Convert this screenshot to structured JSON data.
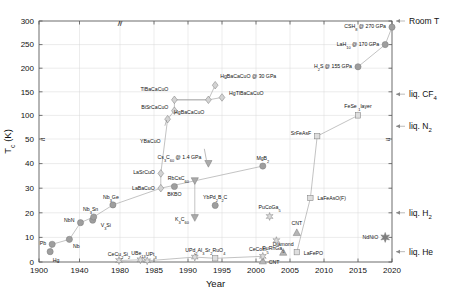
{
  "chart_data": {
    "type": "scatter",
    "title": "",
    "xlabel": "Year",
    "ylabel": "T_c (K)",
    "ylabel_main": "T",
    "ylabel_sub": "c",
    "ylabel_unit": " (K)",
    "grid": true,
    "legend_position": "none",
    "x_axis": {
      "broken": true,
      "break_marker": "//",
      "ticks": [
        1900,
        1940,
        1980,
        1985,
        1990,
        1995,
        2000,
        2005,
        2010,
        2015,
        2020
      ],
      "tick_labels": [
        "1900",
        "1940",
        "1980",
        "1985",
        "1990",
        "1995",
        "2000",
        "2005",
        "2010",
        "2015",
        "2020"
      ],
      "xlim": [
        1900,
        2021
      ]
    },
    "y_axis": {
      "broken": true,
      "break_at": 50,
      "ticks": [
        0,
        10,
        20,
        30,
        40,
        50,
        100,
        150,
        200,
        250,
        300
      ],
      "tick_labels": [
        "0",
        "10",
        "20",
        "30",
        "40",
        "50",
        "100",
        "150",
        "200",
        "250",
        "300"
      ],
      "ylim": [
        0,
        310
      ]
    },
    "right_annotations": [
      {
        "label": "Room T",
        "value": 300
      },
      {
        "label": "liq. CF4",
        "text": "liq. CF",
        "sub": "4",
        "value": 145
      },
      {
        "label": "liq. N2",
        "text": "liq. N",
        "sub": "2",
        "value": 77
      },
      {
        "label": "liq. H2",
        "text": "liq. H",
        "sub": "2",
        "value": 20
      },
      {
        "label": "liq. He",
        "text": "liq. He",
        "sub": "",
        "value": 4.2
      }
    ],
    "series": [
      {
        "name": "BCS / conventional",
        "marker": "circle",
        "color": "#9e9e9e",
        "points": [
          {
            "label": "Hg",
            "text": "Hg",
            "year": 1911,
            "tc": 4.2
          },
          {
            "label": "Pb",
            "text": "Pb",
            "year": 1913,
            "tc": 7.2
          },
          {
            "label": "Nb",
            "text": "Nb",
            "year": 1930,
            "tc": 9.2
          },
          {
            "label": "NbN",
            "text": "NbN",
            "year": 1941,
            "tc": 16.0
          },
          {
            "label": "NbC",
            "text": "V3Si",
            "year": 1953,
            "tc": 17.0
          },
          {
            "label": "Nb3Sn",
            "text": "Nb3Sn",
            "year": 1954,
            "tc": 18.3
          },
          {
            "label": "Nb3Ge",
            "text": "Nb3Ge",
            "year": 1973,
            "tc": 23.2
          },
          {
            "label": "BKBO",
            "text": "BKBO",
            "year": 1988,
            "tc": 30.7
          },
          {
            "label": "YbPd2B2C",
            "text": "YbPd2B2C",
            "year": 1994,
            "tc": 23.0
          },
          {
            "label": "MgB2",
            "text": "MgB2",
            "year": 2001,
            "tc": 39.0
          },
          {
            "label": "H2S",
            "text": "H2S @ 155 GPa",
            "year": 2015,
            "tc": 203.0
          },
          {
            "label": "LaH10",
            "text": "LaH10 @ 170 GPa",
            "year": 2019,
            "tc": 250.0
          },
          {
            "label": "CSH8",
            "text": "CSH8 @ 270 GPa",
            "year": 2020,
            "tc": 287.0
          }
        ]
      },
      {
        "name": "Cuprates",
        "marker": "diamond",
        "color": "#d3d3d3",
        "points": [
          {
            "label": "LaBaCuO",
            "text": "LaBaCuO",
            "year": 1986,
            "tc": 30.0
          },
          {
            "label": "LaSrCuO",
            "text": "LaSrCuO",
            "year": 1986,
            "tc": 36.0
          },
          {
            "label": "YBaCuO",
            "text": "YBaCuO",
            "year": 1987,
            "tc": 92.0
          },
          {
            "label": "BiSrCaCuO",
            "text": "BiSrCaCuO",
            "year": 1988,
            "tc": 110.0
          },
          {
            "label": "TlBaCaCuO",
            "text": "TlBaCaCuO",
            "year": 1988,
            "tc": 133.0
          },
          {
            "label": "HgBaCaCuO",
            "text": "HgBaCaCuO",
            "year": 1993,
            "tc": 133.0
          },
          {
            "label": "HgTlBaCaCuO",
            "text": "HgTlBaCaCuO",
            "year": 1995,
            "tc": 138.0
          },
          {
            "label": "HgBaCaCuO30GPa",
            "text": "HgBaCaCuO @ 30 GPa",
            "year": 1994,
            "tc": 164.0
          }
        ]
      },
      {
        "name": "Fullerenes",
        "marker": "triangle-down",
        "color": "#aaaaaa",
        "points": [
          {
            "label": "K3C60",
            "text": "K3C60",
            "year": 1991,
            "tc": 18.0
          },
          {
            "label": "RbCsC60",
            "text": "RbCsC60",
            "year": 1991,
            "tc": 33.0
          },
          {
            "label": "Cs3C60",
            "text": "Cs3C60 @ 1.4 GPa",
            "year": 1993,
            "tc": 40.0
          }
        ]
      },
      {
        "name": "Carbon allotropes",
        "marker": "triangle-up",
        "color": "#b5b5b5",
        "points": [
          {
            "label": "CNT-low",
            "text": "CNT",
            "year": 2001,
            "tc": 0.5
          },
          {
            "label": "Diamond",
            "text": "Diamond",
            "year": 2004,
            "tc": 4.0
          },
          {
            "label": "CNT-high",
            "text": "CNT",
            "year": 2006,
            "tc": 12.0
          }
        ]
      },
      {
        "name": "Heavy fermions",
        "marker": "star",
        "color": "#dcdcdc",
        "points": [
          {
            "label": "CeCu2Si2",
            "text": "CeCu2Si2",
            "year": 1979,
            "tc": 0.6
          },
          {
            "label": "UBe13",
            "text": "UBe13",
            "year": 1983,
            "tc": 0.9
          },
          {
            "label": "UPt3",
            "text": "UPt3",
            "year": 1984,
            "tc": 0.5
          },
          {
            "label": "UPd2Al3",
            "text": "UPd2Al3",
            "year": 1991,
            "tc": 2.0
          },
          {
            "label": "CeCoIn5",
            "text": "CeCoIn5",
            "year": 2001,
            "tc": 2.3
          },
          {
            "label": "PuCoGa5",
            "text": "PuCoGa5",
            "year": 2002,
            "tc": 18.5
          },
          {
            "label": "PuRhGa5",
            "text": "PuRhGa5",
            "year": 2003,
            "tc": 8.7
          }
        ]
      },
      {
        "name": "Iron-based",
        "marker": "square",
        "color": "#dedede",
        "points": [
          {
            "label": "LaFePO",
            "text": "LaFePO",
            "year": 2006,
            "tc": 4.0
          },
          {
            "label": "Sr2RuO4",
            "text": "Sr2RuO4",
            "year": 1994,
            "tc": 1.5
          },
          {
            "label": "LaFeAsOF",
            "text": "LaFeAsO(F)",
            "year": 2008,
            "tc": 26.0
          },
          {
            "label": "SrFeAsF",
            "text": "SrFeAsF",
            "year": 2009,
            "tc": 56.0
          },
          {
            "label": "FeSe1layer",
            "text": "FeSe 1layer",
            "year": 2015,
            "tc": 100.0
          }
        ]
      },
      {
        "name": "Nickelates",
        "marker": "star6",
        "color": "#7d7d7d",
        "points": [
          {
            "label": "NdNiO",
            "text": "NdNiO",
            "year": 2019,
            "tc": 10.0
          }
        ]
      }
    ]
  },
  "axis": {
    "x_title": "Year",
    "y_title_main": "T",
    "y_title_sub": "c",
    "y_title_unit": " (K)"
  }
}
